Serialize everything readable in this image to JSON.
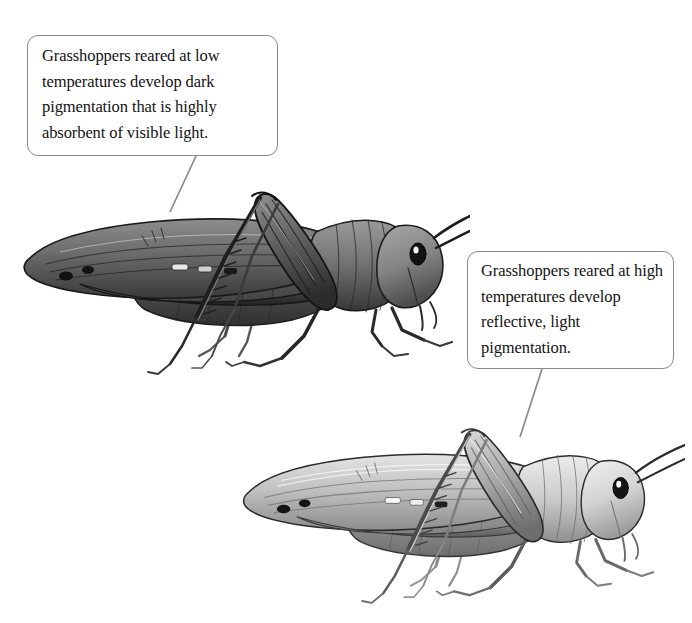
{
  "figure": {
    "background_color": "#ffffff",
    "width": 692,
    "height": 623,
    "style": "grayscale scientific pen-and-ink illustration"
  },
  "callouts": [
    {
      "id": "cold",
      "text": "Grasshoppers reared at low temperatures develop dark pigmentation that is highly absorbent of visible light.",
      "border_color": "#8a8a8a",
      "background_color": "#ffffff",
      "text_color": "#131313"
    },
    {
      "id": "hot",
      "text": "Grasshoppers reared at high temperatures develop reflective, light pigmentation.",
      "border_color": "#8a8a8a",
      "background_color": "#ffffff",
      "text_color": "#131313"
    }
  ],
  "specimens": [
    {
      "id": "dark-grasshopper",
      "label": "dark pigmented grasshopper",
      "tone": "dark",
      "body_fill": "#6f6f6f",
      "shadow_fill": "#2d2d2d",
      "eye_color": "#141414"
    },
    {
      "id": "light-grasshopper",
      "label": "light pigmented grasshopper",
      "tone": "light",
      "body_fill": "#b4b4b4",
      "shadow_fill": "#5a5a5a",
      "eye_color": "#141414"
    }
  ],
  "leader_lines": [
    {
      "id": "cold-leader",
      "color": "#8a8a8a"
    },
    {
      "id": "hot-leader",
      "color": "#8a8a8a"
    }
  ]
}
